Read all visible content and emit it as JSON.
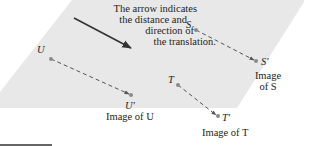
{
  "diagram": {
    "colors": {
      "plane_fill": "#e6e6e6",
      "dash": "#555555",
      "point": "#8a8a8a",
      "arrow": "#333333",
      "text": "#1e1e1e"
    },
    "annotation": {
      "lines": [
        "The arrow indicates",
        "the distance and",
        "direction of",
        "the translation."
      ]
    },
    "points": {
      "S": {
        "label": "S",
        "image_label": "S′",
        "caption_line1": "Image",
        "caption_line2": "of S"
      },
      "T": {
        "label": "T",
        "image_label": "T′",
        "caption": "Image of T"
      },
      "U": {
        "label": "U",
        "image_label": "U′",
        "caption": "Image of U"
      }
    }
  }
}
